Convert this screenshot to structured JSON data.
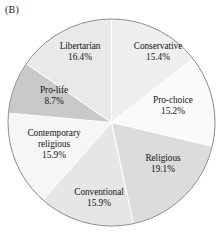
{
  "panel": {
    "label": "(B)"
  },
  "chart_data": {
    "type": "pie",
    "title": "",
    "subtitle": "",
    "xlabel": "",
    "ylabel": "",
    "legend_position": "none",
    "labels_inside_slices": true,
    "start_angle_deg": 0,
    "direction": "clockwise",
    "units": "percent",
    "outline_color": "#8a8a8a",
    "categories": [
      "Conservative",
      "Pro-choice",
      "Religious",
      "Conventional",
      "Contemporary religious",
      "Pro-life",
      "Libertarian"
    ],
    "values": [
      15.4,
      15.2,
      19.1,
      15.9,
      15.9,
      8.7,
      16.4
    ],
    "slices": [
      {
        "name": "Conservative",
        "label": "Conservative",
        "value": 15.4,
        "value_text": "15.4%",
        "color": "#efefef",
        "multiline": false
      },
      {
        "name": "Pro-choice",
        "label": "Pro-choice",
        "value": 15.2,
        "value_text": "15.2%",
        "color": "#fafafa",
        "multiline": false
      },
      {
        "name": "Religious",
        "label": "Religious",
        "value": 19.1,
        "value_text": "19.1%",
        "color": "#dcdcdc",
        "multiline": false
      },
      {
        "name": "Conventional",
        "label": "Conventional",
        "value": 15.9,
        "value_text": "15.9%",
        "color": "#e6e6e6",
        "multiline": false
      },
      {
        "name": "Contemporary religious",
        "label_line1": "Contemporary",
        "label_line2": "religious",
        "value": 15.9,
        "value_text": "15.9%",
        "color": "#f6f6f6",
        "multiline": true
      },
      {
        "name": "Pro-life",
        "label": "Pro-life",
        "value": 8.7,
        "value_text": "8.7%",
        "color": "#c9c9c9",
        "multiline": false
      },
      {
        "name": "Libertarian",
        "label": "Libertarian",
        "value": 16.4,
        "value_text": "16.4%",
        "color": "#e9e9e9",
        "multiline": false
      }
    ]
  }
}
